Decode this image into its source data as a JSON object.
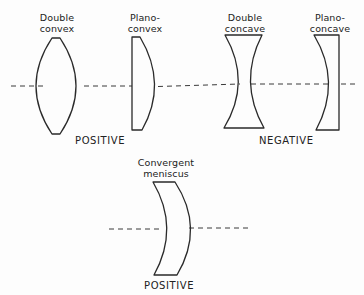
{
  "diagram": {
    "colors": {
      "stroke": "#2a2a2a",
      "axis": "#3a3a3a",
      "background": "#fdfdfd",
      "text": "#222222"
    },
    "lenses": [
      {
        "id": "double-convex",
        "label_line1": "Double",
        "label_line2": "convex",
        "group": "positive"
      },
      {
        "id": "plano-convex",
        "label_line1": "Plano-",
        "label_line2": "convex",
        "group": "positive"
      },
      {
        "id": "double-concave",
        "label_line1": "Double",
        "label_line2": "concave",
        "group": "negative"
      },
      {
        "id": "plano-concave",
        "label_line1": "Plano-",
        "label_line2": "concave",
        "group": "negative"
      },
      {
        "id": "convergent-meniscus",
        "label_line1": "Convergent",
        "label_line2": "meniscus",
        "group": "positive"
      }
    ],
    "groups": {
      "positive_top": "POSITIVE",
      "negative": "NEGATIVE",
      "positive_bottom": "POSITIVE"
    }
  }
}
